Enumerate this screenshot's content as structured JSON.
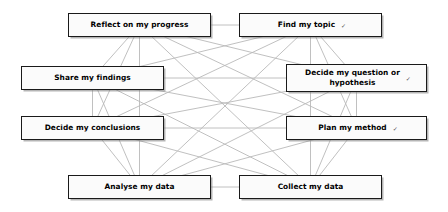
{
  "diagram": {
    "layout": "octagon-full-mesh",
    "edge_color": "#b9b9b9",
    "node_border_color": "#1a1a1a",
    "node_fill_color": "#fbfbfb",
    "trailing_mark": "✓",
    "nodes": [
      {
        "id": "reflect",
        "label": "Reflect on my progress",
        "mark": "",
        "cx": 139.5,
        "cy": 25,
        "position": "top-left"
      },
      {
        "id": "find",
        "label": "Find my topic",
        "mark": "✓",
        "cx": 310.5,
        "cy": 25,
        "position": "top-right"
      },
      {
        "id": "question",
        "label": "Decide my question or\nhypothesis",
        "mark": "✓",
        "cx": 356.5,
        "cy": 78,
        "position": "right-upper"
      },
      {
        "id": "plan",
        "label": "Plan my method",
        "mark": "✓",
        "cx": 356.5,
        "cy": 128,
        "position": "right-lower"
      },
      {
        "id": "collect",
        "label": "Collect my data",
        "mark": "",
        "cx": 310.5,
        "cy": 187,
        "position": "bottom-right"
      },
      {
        "id": "analyse",
        "label": "Analyse my data",
        "mark": "",
        "cx": 139.5,
        "cy": 187,
        "position": "bottom-left"
      },
      {
        "id": "conclude",
        "label": "Decide my conclusions",
        "mark": "",
        "cx": 92.5,
        "cy": 128,
        "position": "left-lower"
      },
      {
        "id": "share",
        "label": "Share my findings",
        "mark": "",
        "cx": 92.5,
        "cy": 78,
        "position": "left-upper"
      }
    ],
    "edges": [
      [
        "reflect",
        "find"
      ],
      [
        "reflect",
        "question"
      ],
      [
        "reflect",
        "plan"
      ],
      [
        "reflect",
        "collect"
      ],
      [
        "reflect",
        "analyse"
      ],
      [
        "reflect",
        "conclude"
      ],
      [
        "reflect",
        "share"
      ],
      [
        "find",
        "question"
      ],
      [
        "find",
        "plan"
      ],
      [
        "find",
        "collect"
      ],
      [
        "find",
        "analyse"
      ],
      [
        "find",
        "conclude"
      ],
      [
        "find",
        "share"
      ],
      [
        "question",
        "plan"
      ],
      [
        "question",
        "collect"
      ],
      [
        "question",
        "analyse"
      ],
      [
        "question",
        "conclude"
      ],
      [
        "question",
        "share"
      ],
      [
        "plan",
        "collect"
      ],
      [
        "plan",
        "analyse"
      ],
      [
        "plan",
        "conclude"
      ],
      [
        "plan",
        "share"
      ],
      [
        "collect",
        "analyse"
      ],
      [
        "collect",
        "conclude"
      ],
      [
        "collect",
        "share"
      ],
      [
        "analyse",
        "conclude"
      ],
      [
        "analyse",
        "share"
      ],
      [
        "conclude",
        "share"
      ]
    ]
  }
}
